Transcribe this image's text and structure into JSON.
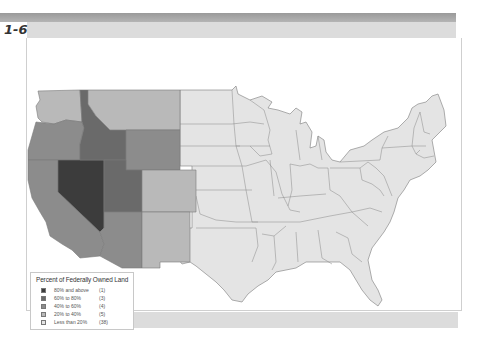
{
  "figure": {
    "label": "1-6"
  },
  "legend": {
    "title": "Percent of Federally Owned Land",
    "items": [
      {
        "label": "80% and above",
        "count": "(1)",
        "color": "#3c3c3c"
      },
      {
        "label": "60% to 80%",
        "count": "(3)",
        "color": "#6a6a6a"
      },
      {
        "label": "40% to 60%",
        "count": "(4)",
        "color": "#8c8c8c"
      },
      {
        "label": "20% to 40%",
        "count": "(5)",
        "color": "#b9b9b9"
      },
      {
        "label": "Less than 20%",
        "count": "(38)",
        "color": "#e4e4e4"
      }
    ]
  },
  "map": {
    "title": "Percent of Federally Owned Land by State",
    "states": [
      {
        "name": "Nevada",
        "category": "80% and above"
      },
      {
        "name": "Idaho",
        "category": "60% to 80%"
      },
      {
        "name": "Utah",
        "category": "60% to 80%"
      },
      {
        "name": "Oregon",
        "category": "40% to 60%"
      },
      {
        "name": "California",
        "category": "40% to 60%"
      },
      {
        "name": "Wyoming",
        "category": "40% to 60%"
      },
      {
        "name": "Arizona",
        "category": "40% to 60%"
      },
      {
        "name": "Washington",
        "category": "20% to 40%"
      },
      {
        "name": "Montana",
        "category": "20% to 40%"
      },
      {
        "name": "Colorado",
        "category": "20% to 40%"
      },
      {
        "name": "New Mexico",
        "category": "20% to 40%"
      }
    ],
    "other_states_category": "Less than 20%"
  },
  "colors": {
    "cat80": "#3c3c3c",
    "cat60": "#6a6a6a",
    "cat40": "#8c8c8c",
    "cat20": "#b9b9b9",
    "cat0": "#e4e4e4",
    "border": "#7a7a7a"
  }
}
